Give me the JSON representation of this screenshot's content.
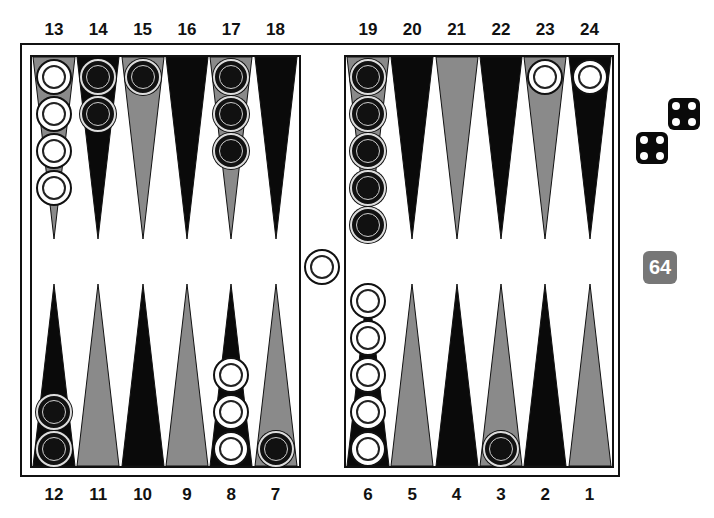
{
  "colors": {
    "dark_point": "#0a0a0a",
    "light_point": "#8a8a8a",
    "board": "#ffffff",
    "white_checker": "#ffffff",
    "black_checker": "#111111",
    "cube": "#777777"
  },
  "top_labels": [
    "13",
    "14",
    "15",
    "16",
    "17",
    "18",
    "19",
    "20",
    "21",
    "22",
    "23",
    "24"
  ],
  "bottom_labels": [
    "12",
    "11",
    "10",
    "9",
    "8",
    "7",
    "6",
    "5",
    "4",
    "3",
    "2",
    "1"
  ],
  "points": {
    "13": {
      "color": "light",
      "checkers": 4,
      "owner": "white"
    },
    "14": {
      "color": "dark",
      "checkers": 2,
      "owner": "black"
    },
    "15": {
      "color": "light",
      "checkers": 1,
      "owner": "black"
    },
    "16": {
      "color": "dark",
      "checkers": 0,
      "owner": null
    },
    "17": {
      "color": "light",
      "checkers": 3,
      "owner": "black"
    },
    "18": {
      "color": "dark",
      "checkers": 0,
      "owner": null
    },
    "19": {
      "color": "light",
      "checkers": 5,
      "owner": "black"
    },
    "20": {
      "color": "dark",
      "checkers": 0,
      "owner": null
    },
    "21": {
      "color": "light",
      "checkers": 0,
      "owner": null
    },
    "22": {
      "color": "dark",
      "checkers": 0,
      "owner": null
    },
    "23": {
      "color": "light",
      "checkers": 1,
      "owner": "white"
    },
    "24": {
      "color": "dark",
      "checkers": 1,
      "owner": "white"
    },
    "12": {
      "color": "dark",
      "checkers": 2,
      "owner": "black"
    },
    "11": {
      "color": "light",
      "checkers": 0,
      "owner": null
    },
    "10": {
      "color": "dark",
      "checkers": 0,
      "owner": null
    },
    "9": {
      "color": "light",
      "checkers": 0,
      "owner": null
    },
    "8": {
      "color": "dark",
      "checkers": 3,
      "owner": "white"
    },
    "7": {
      "color": "light",
      "checkers": 1,
      "owner": "black"
    },
    "6": {
      "color": "dark",
      "checkers": 5,
      "owner": "white"
    },
    "5": {
      "color": "light",
      "checkers": 0,
      "owner": null
    },
    "4": {
      "color": "dark",
      "checkers": 0,
      "owner": null
    },
    "3": {
      "color": "light",
      "checkers": 1,
      "owner": "black"
    },
    "2": {
      "color": "dark",
      "checkers": 0,
      "owner": null
    },
    "1": {
      "color": "light",
      "checkers": 0,
      "owner": null
    }
  },
  "bar": {
    "white": 1,
    "black": 0
  },
  "dice": [
    4,
    4
  ],
  "cube": {
    "value": "64"
  }
}
